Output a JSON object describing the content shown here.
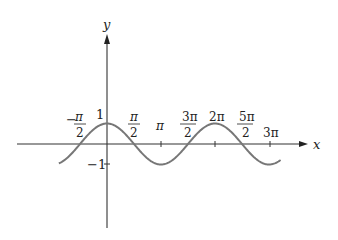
{
  "chart_data": {
    "type": "line",
    "title": "",
    "function": "y = cos(x)",
    "xlabel": "x",
    "ylabel": "y",
    "xlim": [
      -3.7,
      6.0
    ],
    "ylim": [
      -1,
      1
    ],
    "x_ticks": [
      {
        "value": -1.5708,
        "num": "−",
        "top": "π",
        "bottom": "2",
        "label": "−π/2"
      },
      {
        "value": 1.5708,
        "top": "π",
        "bottom": "2",
        "label": "π/2"
      },
      {
        "value": 3.1416,
        "label": "π"
      },
      {
        "value": 4.7124,
        "top": "3π",
        "bottom": "2",
        "label": "3π/2"
      },
      {
        "value": 6.2832,
        "label": "2π"
      },
      {
        "value": 7.854,
        "top": "5π",
        "bottom": "2",
        "label": "5π/2"
      },
      {
        "value": 9.4248,
        "label": "3π"
      }
    ],
    "y_ticks": [
      {
        "value": 1,
        "label": "1"
      },
      {
        "value": -1,
        "label": "−1"
      }
    ],
    "curve_range": [
      -2.8,
      10.1
    ],
    "grid": false,
    "colors": {
      "axis": "#333333",
      "curve": "#777777",
      "text": "#222222"
    }
  },
  "labels": {
    "x_axis": "x",
    "y_axis": "y",
    "one": "1",
    "minus_one": "−1",
    "neg_half_pi_sign": "−",
    "neg_half_pi_top": "π",
    "neg_half_pi_bottom": "2",
    "half_pi_top": "π",
    "half_pi_bottom": "2",
    "pi": "π",
    "three_half_pi_top": "3π",
    "three_half_pi_bottom": "2",
    "two_pi": "2π",
    "five_half_pi_top": "5π",
    "five_half_pi_bottom": "2",
    "three_pi": "3π"
  }
}
